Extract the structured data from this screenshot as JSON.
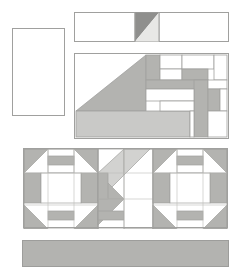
{
  "document": {
    "title": "Quilt Block Layout Diagram",
    "canvas_width": 237,
    "canvas_height": 277,
    "background_color": "#ffffff"
  },
  "palette": {
    "white": "#ffffff",
    "light_gray": "#e8e8e6",
    "medium_gray": "#b3b3b0",
    "dark_gray": "#8f8f8d",
    "stroke": "#a0a09e",
    "stroke_light": "#bdbdbb"
  },
  "panels": [
    {
      "name": "left-tall-panel",
      "label": "Plain Border Rectangle",
      "x": 12,
      "y": 28,
      "w": 53,
      "h": 88,
      "fill": "#ffffff"
    },
    {
      "name": "top-strip-panel",
      "label": "Top Sashing Strip with Half-Square Triangle",
      "x": 74,
      "y": 12,
      "w": 155,
      "h": 30,
      "fill": "#ffffff",
      "hst": {
        "x": 0.395,
        "w": 0.155,
        "upper_fill": "#8f8f8d",
        "lower_fill": "#e8e8e6"
      }
    },
    {
      "name": "center-block-panel",
      "label": "Asymmetric Pieced Block",
      "x": 74,
      "y": 53,
      "w": 155,
      "h": 86,
      "fill": "#ffffff"
    },
    {
      "name": "three-block-panel",
      "label": "Row of Three Pieced Blocks",
      "x": 22,
      "y": 147,
      "w": 207,
      "h": 82,
      "fill": "#ffffff"
    },
    {
      "name": "bottom-strip-panel",
      "label": "Bottom Solid Border Strip",
      "x": 22,
      "y": 240,
      "w": 207,
      "h": 27,
      "fill": "#b3b3b0"
    }
  ],
  "center_block": {
    "name": "center-block",
    "big_triangle": {
      "fill": "#b3b3b0",
      "points": "0,58 72,0 72,58"
    },
    "bottom_bar": {
      "fill": "#c9c9c7",
      "x": 0,
      "y": 58,
      "w": 116,
      "h": 28
    },
    "grid_cells": [
      {
        "name": "cell-top-1",
        "x": 72,
        "y": 0,
        "w": 14,
        "h": 27,
        "fill": "#b3b3b0"
      },
      {
        "name": "cell-top-2",
        "x": 86,
        "y": 0,
        "w": 22,
        "h": 16,
        "fill": "#ffffff"
      },
      {
        "name": "cell-top-3",
        "x": 86,
        "y": 16,
        "w": 22,
        "h": 11,
        "fill": "#ffffff"
      },
      {
        "name": "cell-top-4",
        "x": 108,
        "y": 0,
        "w": 32,
        "h": 16,
        "fill": "#ffffff"
      },
      {
        "name": "cell-top-5",
        "x": 140,
        "y": 0,
        "w": 15,
        "h": 27,
        "fill": "#ffffff"
      },
      {
        "name": "cell-bar-a",
        "x": 108,
        "y": 16,
        "w": 26,
        "h": 11,
        "fill": "#b3b3b0"
      },
      {
        "name": "cell-mid-bar",
        "x": 72,
        "y": 27,
        "w": 62,
        "h": 9,
        "fill": "#b3b3b0"
      },
      {
        "name": "cell-vert-bar",
        "x": 120,
        "y": 27,
        "w": 14,
        "h": 59,
        "fill": "#b3b3b0"
      },
      {
        "name": "cell-right-bar",
        "x": 134,
        "y": 36,
        "w": 12,
        "h": 22,
        "fill": "#b3b3b0"
      },
      {
        "name": "cell-inner-white-1",
        "x": 72,
        "y": 36,
        "w": 48,
        "h": 12,
        "fill": "#ffffff"
      },
      {
        "name": "cell-inner-white-2",
        "x": 86,
        "y": 48,
        "w": 34,
        "h": 10,
        "fill": "#ffffff"
      },
      {
        "name": "cell-right-white-1",
        "x": 134,
        "y": 27,
        "w": 21,
        "h": 9,
        "fill": "#ffffff"
      },
      {
        "name": "cell-right-white-2",
        "x": 146,
        "y": 36,
        "w": 9,
        "h": 22,
        "fill": "#ffffff"
      },
      {
        "name": "cell-right-white-3",
        "x": 134,
        "y": 58,
        "w": 21,
        "h": 28,
        "fill": "#ffffff"
      },
      {
        "name": "cell-bottom-white",
        "x": 116,
        "y": 58,
        "w": 4,
        "h": 28,
        "fill": "#ffffff"
      }
    ]
  },
  "churn_block": {
    "name": "octagon-block",
    "corner_fill": "#b3b3b0",
    "edge_bar_fill": "#b3b3b0",
    "center_fill": "#ffffff",
    "ring_fill": "#ffffff"
  },
  "center_pinwheel": {
    "name": "pinwheel-block",
    "tri_light": "#d2d2d0",
    "tri_medium": "#b3b3b0",
    "tri_dark": "#a8a8a6",
    "white": "#ffffff"
  }
}
